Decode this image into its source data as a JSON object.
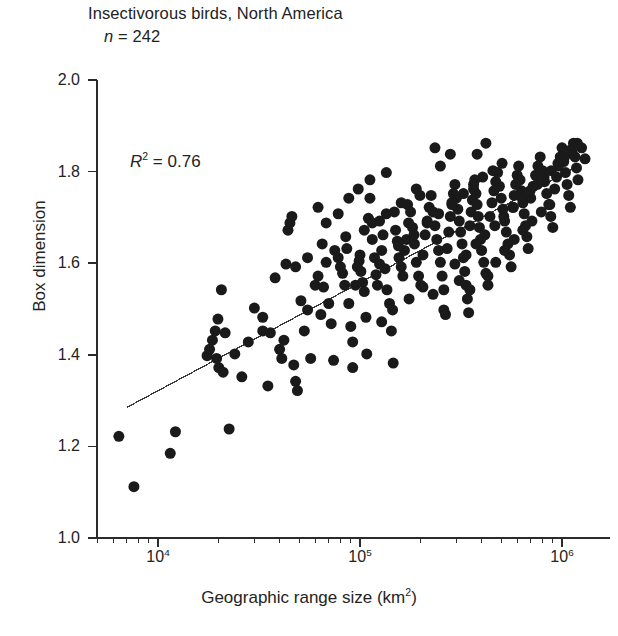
{
  "figure": {
    "title_line1": "Insectivorous birds, North America",
    "title_n_prefix": "n",
    "title_n_value": " = 242",
    "annotation_r": "R",
    "annotation_sup": "2",
    "annotation_value": " = 0.76"
  },
  "chart_data": {
    "type": "scatter",
    "title": "Insectivorous birds, North America",
    "subtitle": "n = 242",
    "annotation": "R2 = 0.76",
    "n": 242,
    "r_squared": 0.76,
    "xlabel": "Geographic range size (km2)",
    "ylabel": "Box dimension",
    "xscale": "log",
    "yscale": "linear",
    "xlim": [
      5500,
      1800000
    ],
    "ylim": [
      1.0,
      2.0
    ],
    "grid": false,
    "legend": false,
    "yticks": [
      "2.0",
      "1.8",
      "1.6",
      "1.4",
      "1.2",
      "1.0"
    ],
    "ytick_values": [
      2.0,
      1.8,
      1.6,
      1.4,
      1.2,
      1.0
    ],
    "xticks": [
      {
        "label_base": "10",
        "label_exp": "4",
        "value": 10000
      },
      {
        "label_base": "10",
        "label_exp": "5",
        "value": 100000
      },
      {
        "label_base": "10",
        "label_exp": "6",
        "value": 1000000
      }
    ],
    "marker": {
      "shape": "circle",
      "filled": true,
      "color": "#1a1a1a",
      "size_px": 11
    },
    "trendline": {
      "x_start": 7000,
      "y_start": 1.285,
      "x_end": 1200000,
      "y_end": 1.812,
      "color": "#3a3a3a"
    },
    "points": [
      [
        6400,
        1.222
      ],
      [
        7600,
        1.112
      ],
      [
        11500,
        1.185
      ],
      [
        12200,
        1.232
      ],
      [
        18000,
        1.412
      ],
      [
        18600,
        1.432
      ],
      [
        19200,
        1.452
      ],
      [
        19500,
        1.392
      ],
      [
        20000,
        1.372
      ],
      [
        20600,
        1.542
      ],
      [
        21000,
        1.362
      ],
      [
        22500,
        1.238
      ],
      [
        26000,
        1.352
      ],
      [
        30000,
        1.502
      ],
      [
        33000,
        1.452
      ],
      [
        35000,
        1.332
      ],
      [
        36000,
        1.448
      ],
      [
        38000,
        1.568
      ],
      [
        40000,
        1.412
      ],
      [
        41000,
        1.392
      ],
      [
        42000,
        1.432
      ],
      [
        43000,
        1.598
      ],
      [
        44000,
        1.672
      ],
      [
        45000,
        1.688
      ],
      [
        46000,
        1.702
      ],
      [
        47000,
        1.378
      ],
      [
        48000,
        1.342
      ],
      [
        49000,
        1.322
      ],
      [
        51000,
        1.518
      ],
      [
        53000,
        1.452
      ],
      [
        55000,
        1.498
      ],
      [
        57000,
        1.392
      ],
      [
        60000,
        1.552
      ],
      [
        62000,
        1.572
      ],
      [
        64000,
        1.488
      ],
      [
        66000,
        1.548
      ],
      [
        68000,
        1.602
      ],
      [
        70000,
        1.512
      ],
      [
        72000,
        1.468
      ],
      [
        74000,
        1.388
      ],
      [
        78000,
        1.612
      ],
      [
        80000,
        1.592
      ],
      [
        82000,
        1.578
      ],
      [
        84000,
        1.552
      ],
      [
        86000,
        1.632
      ],
      [
        88000,
        1.512
      ],
      [
        90000,
        1.462
      ],
      [
        92000,
        1.428
      ],
      [
        95000,
        1.552
      ],
      [
        97000,
        1.592
      ],
      [
        99000,
        1.605
      ],
      [
        100000,
        1.618
      ],
      [
        101000,
        1.582
      ],
      [
        103000,
        1.558
      ],
      [
        105000,
        1.538
      ],
      [
        107000,
        1.482
      ],
      [
        110000,
        1.698
      ],
      [
        112000,
        1.742
      ],
      [
        115000,
        1.652
      ],
      [
        118000,
        1.612
      ],
      [
        120000,
        1.575
      ],
      [
        122000,
        1.552
      ],
      [
        125000,
        1.598
      ],
      [
        128000,
        1.628
      ],
      [
        130000,
        1.662
      ],
      [
        133000,
        1.588
      ],
      [
        136000,
        1.542
      ],
      [
        140000,
        1.512
      ],
      [
        143000,
        1.452
      ],
      [
        146000,
        1.382
      ],
      [
        150000,
        1.672
      ],
      [
        153000,
        1.648
      ],
      [
        156000,
        1.612
      ],
      [
        160000,
        1.592
      ],
      [
        163000,
        1.572
      ],
      [
        166000,
        1.628
      ],
      [
        170000,
        1.652
      ],
      [
        174000,
        1.688
      ],
      [
        178000,
        1.712
      ],
      [
        182000,
        1.678
      ],
      [
        186000,
        1.642
      ],
      [
        190000,
        1.602
      ],
      [
        195000,
        1.572
      ],
      [
        200000,
        1.552
      ],
      [
        205000,
        1.618
      ],
      [
        210000,
        1.662
      ],
      [
        215000,
        1.692
      ],
      [
        220000,
        1.722
      ],
      [
        225000,
        1.748
      ],
      [
        230000,
        1.712
      ],
      [
        235000,
        1.682
      ],
      [
        240000,
        1.652
      ],
      [
        245000,
        1.628
      ],
      [
        250000,
        1.602
      ],
      [
        255000,
        1.572
      ],
      [
        260000,
        1.542
      ],
      [
        265000,
        1.488
      ],
      [
        270000,
        1.632
      ],
      [
        275000,
        1.668
      ],
      [
        280000,
        1.702
      ],
      [
        285000,
        1.728
      ],
      [
        290000,
        1.752
      ],
      [
        295000,
        1.772
      ],
      [
        300000,
        1.742
      ],
      [
        305000,
        1.718
      ],
      [
        310000,
        1.692
      ],
      [
        315000,
        1.668
      ],
      [
        320000,
        1.642
      ],
      [
        325000,
        1.612
      ],
      [
        330000,
        1.582
      ],
      [
        335000,
        1.552
      ],
      [
        340000,
        1.522
      ],
      [
        345000,
        1.492
      ],
      [
        350000,
        1.682
      ],
      [
        355000,
        1.712
      ],
      [
        360000,
        1.738
      ],
      [
        365000,
        1.762
      ],
      [
        370000,
        1.782
      ],
      [
        375000,
        1.752
      ],
      [
        380000,
        1.728
      ],
      [
        385000,
        1.702
      ],
      [
        390000,
        1.678
      ],
      [
        395000,
        1.652
      ],
      [
        400000,
        1.628
      ],
      [
        410000,
        1.602
      ],
      [
        420000,
        1.578
      ],
      [
        430000,
        1.552
      ],
      [
        440000,
        1.702
      ],
      [
        450000,
        1.732
      ],
      [
        460000,
        1.758
      ],
      [
        470000,
        1.778
      ],
      [
        480000,
        1.798
      ],
      [
        490000,
        1.768
      ],
      [
        500000,
        1.742
      ],
      [
        510000,
        1.718
      ],
      [
        520000,
        1.692
      ],
      [
        530000,
        1.668
      ],
      [
        540000,
        1.642
      ],
      [
        550000,
        1.618
      ],
      [
        560000,
        1.592
      ],
      [
        570000,
        1.722
      ],
      [
        580000,
        1.748
      ],
      [
        590000,
        1.772
      ],
      [
        600000,
        1.792
      ],
      [
        610000,
        1.812
      ],
      [
        620000,
        1.782
      ],
      [
        630000,
        1.758
      ],
      [
        640000,
        1.732
      ],
      [
        650000,
        1.708
      ],
      [
        660000,
        1.682
      ],
      [
        670000,
        1.658
      ],
      [
        680000,
        1.632
      ],
      [
        700000,
        1.742
      ],
      [
        720000,
        1.768
      ],
      [
        740000,
        1.792
      ],
      [
        760000,
        1.812
      ],
      [
        780000,
        1.832
      ],
      [
        800000,
        1.802
      ],
      [
        820000,
        1.778
      ],
      [
        840000,
        1.752
      ],
      [
        860000,
        1.728
      ],
      [
        880000,
        1.702
      ],
      [
        900000,
        1.678
      ],
      [
        920000,
        1.762
      ],
      [
        940000,
        1.788
      ],
      [
        960000,
        1.812
      ],
      [
        980000,
        1.832
      ],
      [
        1000000,
        1.852
      ],
      [
        1020000,
        1.822
      ],
      [
        1040000,
        1.798
      ],
      [
        1060000,
        1.772
      ],
      [
        1080000,
        1.748
      ],
      [
        1100000,
        1.722
      ],
      [
        1120000,
        1.842
      ],
      [
        1140000,
        1.862
      ],
      [
        1160000,
        1.832
      ],
      [
        1180000,
        1.808
      ],
      [
        1200000,
        1.782
      ],
      [
        1250000,
        1.852
      ],
      [
        1300000,
        1.828
      ],
      [
        380000,
        1.838
      ],
      [
        420000,
        1.862
      ],
      [
        250000,
        1.812
      ],
      [
        280000,
        1.838
      ],
      [
        190000,
        1.762
      ],
      [
        160000,
        1.732
      ],
      [
        135000,
        1.708
      ],
      [
        115000,
        1.688
      ],
      [
        230000,
        1.532
      ],
      [
        260000,
        1.498
      ],
      [
        310000,
        1.562
      ],
      [
        350000,
        1.542
      ],
      [
        430000,
        1.572
      ],
      [
        470000,
        1.602
      ],
      [
        520000,
        1.628
      ],
      [
        580000,
        1.652
      ],
      [
        640000,
        1.672
      ],
      [
        710000,
        1.692
      ],
      [
        790000,
        1.712
      ],
      [
        870000,
        1.728
      ],
      [
        128000,
        1.472
      ],
      [
        145000,
        1.498
      ],
      [
        175000,
        1.522
      ],
      [
        205000,
        1.548
      ],
      [
        92000,
        1.372
      ],
      [
        108000,
        1.402
      ],
      [
        155000,
        1.638
      ],
      [
        185000,
        1.662
      ],
      [
        215000,
        1.688
      ],
      [
        245000,
        1.708
      ],
      [
        285000,
        1.732
      ],
      [
        325000,
        1.752
      ],
      [
        365000,
        1.772
      ],
      [
        405000,
        1.788
      ],
      [
        455000,
        1.802
      ],
      [
        505000,
        1.818
      ],
      [
        65000,
        1.642
      ],
      [
        75000,
        1.628
      ],
      [
        85000,
        1.658
      ],
      [
        105000,
        1.672
      ],
      [
        125000,
        1.692
      ],
      [
        148000,
        1.712
      ],
      [
        172000,
        1.728
      ],
      [
        198000,
        1.748
      ],
      [
        55000,
        1.612
      ],
      [
        48000,
        1.592
      ],
      [
        33000,
        1.482
      ],
      [
        28000,
        1.428
      ],
      [
        24000,
        1.402
      ],
      [
        21500,
        1.448
      ],
      [
        19800,
        1.478
      ],
      [
        17500,
        1.398
      ],
      [
        295000,
        1.598
      ],
      [
        335000,
        1.618
      ],
      [
        375000,
        1.642
      ],
      [
        415000,
        1.662
      ],
      [
        465000,
        1.682
      ],
      [
        515000,
        1.702
      ],
      [
        575000,
        1.722
      ],
      [
        635000,
        1.742
      ],
      [
        695000,
        1.758
      ],
      [
        755000,
        1.772
      ],
      [
        815000,
        1.788
      ],
      [
        885000,
        1.802
      ],
      [
        955000,
        1.818
      ],
      [
        1030000,
        1.832
      ],
      [
        1110000,
        1.848
      ],
      [
        1190000,
        1.862
      ],
      [
        98000,
        1.762
      ],
      [
        112000,
        1.782
      ],
      [
        135000,
        1.798
      ],
      [
        235000,
        1.852
      ],
      [
        62000,
        1.722
      ],
      [
        88000,
        1.742
      ],
      [
        68000,
        1.688
      ],
      [
        78000,
        1.708
      ]
    ]
  }
}
